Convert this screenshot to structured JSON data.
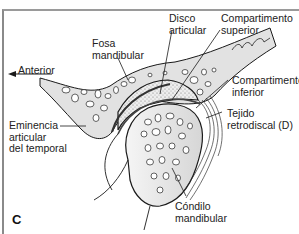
{
  "figure": {
    "panel_letter": "C",
    "direction": {
      "label": "Anterior",
      "arrow": "left-arrow"
    },
    "labels": {
      "fosa": [
        "Fosa",
        "mandibular"
      ],
      "disco": [
        "Disco",
        "articular"
      ],
      "comp_sup": [
        "Compartimento",
        "superior"
      ],
      "comp_inf": [
        "Compartimento",
        "inferior"
      ],
      "tejido": [
        "Tejido",
        "retrodiscal (D)"
      ],
      "eminencia": [
        "Eminencia",
        "articular",
        "del temporal"
      ],
      "condilo": [
        "Cóndilo",
        "mandibular"
      ]
    },
    "colors": {
      "bone_fill": "#e2e2e2",
      "outline": "#1a1a1a",
      "disc_fill": "#ececec",
      "frame": "#8a8a8a"
    }
  }
}
